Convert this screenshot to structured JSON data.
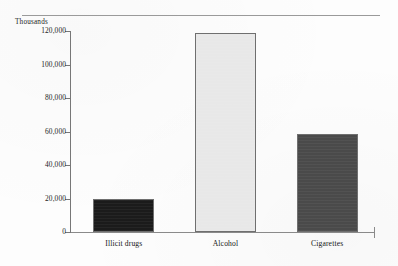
{
  "chart_data": {
    "type": "bar",
    "title": "",
    "subtitle": "",
    "unit_label": "Thousands",
    "xlabel": "",
    "ylabel": "",
    "categories": [
      "Illicit drugs",
      "Alcohol",
      "Cigarettes"
    ],
    "values": [
      19500,
      119000,
      58500
    ],
    "value_labels": [
      "19,500",
      "119,000",
      "58,500"
    ],
    "bar_colors": [
      "#1b1b1b",
      "#e8e8e8",
      "#4a4a4a"
    ],
    "bar_border_color": "#6f6f6f",
    "ylim": [
      0,
      120000
    ],
    "y_ticks": [
      0,
      20000,
      40000,
      60000,
      80000,
      100000,
      120000
    ],
    "y_tick_labels": [
      "0",
      "20,000",
      "40,000",
      "60,000",
      "80,000",
      "100,000",
      "120,000"
    ],
    "grid": false,
    "legend": null,
    "legend_position": "none",
    "annotations": [],
    "series": [
      {
        "name": "Past month users",
        "values": [
          19500,
          119000,
          58500
        ]
      }
    ]
  },
  "figure": {
    "axis_line_color": "#777777",
    "rule_color": "#9a9a9a",
    "background": "#fdfdfd"
  }
}
